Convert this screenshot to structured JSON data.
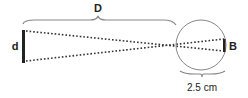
{
  "diagram": {
    "labels": {
      "distance": "D",
      "object_size": "d",
      "image_size": "B",
      "eye_diameter": "2.5 cm"
    },
    "colors": {
      "stroke": "#222222",
      "thin_stroke": "#888888",
      "dots": "#333333"
    },
    "elements": [
      {
        "id": "object-bar",
        "label": "d",
        "description": "thick vertical bar representing the object"
      },
      {
        "id": "distance-brace",
        "label": "D",
        "description": "brace spanning from object to eye"
      },
      {
        "id": "ray-lines",
        "description": "two dotted rays crossing at the front of the eye"
      },
      {
        "id": "eye-circle",
        "description": "circle representing the eyeball"
      },
      {
        "id": "image-bar",
        "label": "B",
        "description": "short vertical bar on the retina"
      },
      {
        "id": "eye-brace",
        "label": "2.5 cm",
        "description": "brace under the eye marking its diameter"
      }
    ]
  }
}
